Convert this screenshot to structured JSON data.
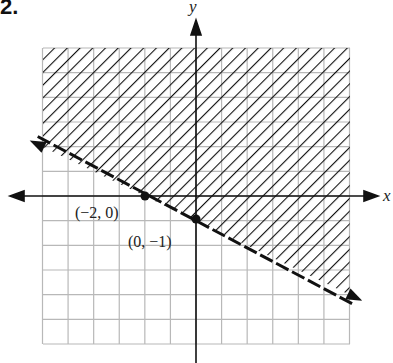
{
  "problem_number": "2.",
  "chart_data": {
    "type": "line",
    "title": "",
    "xlabel": "x",
    "ylabel": "y",
    "xlim": [
      -6,
      6
    ],
    "ylim": [
      -6,
      6
    ],
    "grid": true,
    "boundary_line": {
      "style": "dashed",
      "slope": -0.5,
      "intercept": -1
    },
    "shaded_region": "above",
    "points": [
      {
        "x": -2,
        "y": 0,
        "label": "(−2, 0)"
      },
      {
        "x": 0,
        "y": -1,
        "label": "(0, −1)"
      }
    ]
  },
  "labels": {
    "x_axis": "x",
    "y_axis": "y",
    "point1": "(−2, 0)",
    "point2": "(0, −1)"
  }
}
